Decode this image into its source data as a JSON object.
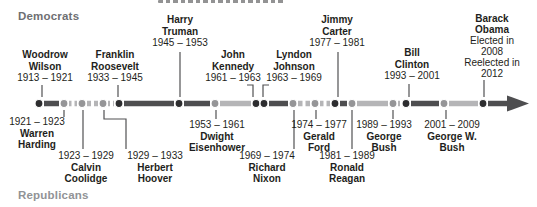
{
  "legend": {
    "democrats": "Democrats",
    "republicans": "Republicans"
  },
  "colors": {
    "background": "#ffffff",
    "democrat_bar": "#4e4e50",
    "democrat_dot": "#2d2d2f",
    "republican_bar": "#b5b5b7",
    "republican_dot": "#959597",
    "connector": "#515153",
    "text": "#1e1e20",
    "democrats_header": "#6e6f72",
    "republicans_header": "#919396",
    "arrow": "#4e4e50"
  },
  "chart_data": {
    "type": "timeline",
    "title": "",
    "groups": {
      "above": "Democrats",
      "below": "Republicans"
    },
    "axis": {
      "start_year": 1913,
      "arrow_end": "present"
    },
    "presidents": [
      {
        "id": "wilson",
        "name": "Woodrow Wilson",
        "name_lines": [
          "Woodrow",
          "Wilson"
        ],
        "term": "1913 – 1921",
        "start": 1913,
        "end": 1921,
        "party": "Democrat"
      },
      {
        "id": "harding",
        "name": "Warren Harding",
        "name_lines": [
          "Warren",
          "Harding"
        ],
        "term": "1921 – 1923",
        "start": 1921,
        "end": 1923,
        "party": "Republican"
      },
      {
        "id": "coolidge",
        "name": "Calvin Coolidge",
        "name_lines": [
          "Calvin",
          "Coolidge"
        ],
        "term": "1923 – 1929",
        "start": 1923,
        "end": 1929,
        "party": "Republican"
      },
      {
        "id": "hoover",
        "name": "Herbert Hoover",
        "name_lines": [
          "Herbert",
          "Hoover"
        ],
        "term": "1929 – 1933",
        "start": 1929,
        "end": 1933,
        "party": "Republican"
      },
      {
        "id": "fdr",
        "name": "Franklin Roosevelt",
        "name_lines": [
          "Franklin",
          "Roosevelt"
        ],
        "term": "1933 – 1945",
        "start": 1933,
        "end": 1945,
        "party": "Democrat"
      },
      {
        "id": "truman",
        "name": "Harry Truman",
        "name_lines": [
          "Harry",
          "Truman"
        ],
        "term": "1945 – 1953",
        "start": 1945,
        "end": 1953,
        "party": "Democrat"
      },
      {
        "id": "eisenhower",
        "name": "Dwight Eisenhower",
        "name_lines": [
          "Dwight",
          "Eisenhower"
        ],
        "term": "1953 – 1961",
        "start": 1953,
        "end": 1961,
        "party": "Republican"
      },
      {
        "id": "kennedy",
        "name": "John Kennedy",
        "name_lines": [
          "John",
          "Kennedy"
        ],
        "term": "1961 – 1963",
        "start": 1961,
        "end": 1963,
        "party": "Democrat"
      },
      {
        "id": "johnson",
        "name": "Lyndon Johnson",
        "name_lines": [
          "Lyndon",
          "Johnson"
        ],
        "term": "1963 – 1969",
        "start": 1963,
        "end": 1969,
        "party": "Democrat"
      },
      {
        "id": "nixon",
        "name": "Richard Nixon",
        "name_lines": [
          "Richard",
          "Nixon"
        ],
        "term": "1969 – 1974",
        "start": 1969,
        "end": 1974,
        "party": "Republican"
      },
      {
        "id": "ford",
        "name": "Gerald Ford",
        "name_lines": [
          "Gerald",
          "Ford"
        ],
        "term": "1974 – 1977",
        "start": 1974,
        "end": 1977,
        "party": "Republican"
      },
      {
        "id": "carter",
        "name": "Jimmy Carter",
        "name_lines": [
          "Jimmy",
          "Carter"
        ],
        "term": "1977 – 1981",
        "start": 1977,
        "end": 1981,
        "party": "Democrat"
      },
      {
        "id": "reagan",
        "name": "Ronald Reagan",
        "name_lines": [
          "Ronald",
          "Reagan"
        ],
        "term": "1981 – 1989",
        "start": 1981,
        "end": 1989,
        "party": "Republican"
      },
      {
        "id": "ghwbush",
        "name": "George Bush",
        "name_lines": [
          "George",
          "Bush"
        ],
        "term": "1989 – 1993",
        "start": 1989,
        "end": 1993,
        "party": "Republican"
      },
      {
        "id": "clinton",
        "name": "Bill Clinton",
        "name_lines": [
          "Bill",
          "Clinton"
        ],
        "term": "1993 – 2001",
        "start": 1993,
        "end": 2001,
        "party": "Democrat"
      },
      {
        "id": "gwbush",
        "name": "George W. Bush",
        "name_lines": [
          "George W.",
          "Bush"
        ],
        "term": "2001 – 2009",
        "start": 2001,
        "end": 2009,
        "party": "Republican"
      },
      {
        "id": "obama",
        "name": "Barack Obama",
        "name_lines": [
          "Barack",
          "Obama"
        ],
        "note_lines": [
          "Elected in",
          "2008",
          "Reelected in",
          "2012"
        ],
        "start": 2009,
        "party": "Democrat"
      }
    ]
  }
}
